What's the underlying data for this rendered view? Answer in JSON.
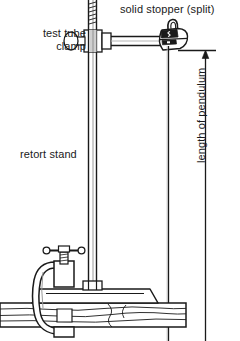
{
  "diagram": {
    "type": "physics-apparatus-line-drawing",
    "stroke_color": "#1a1a1a",
    "fill_color": "#ffffff",
    "background": "#ffffff",
    "width": 240,
    "height": 341
  },
  "labels": {
    "test_tube_clamp": "test tube\nclamp",
    "test_tube_clamp_line1": "test tube",
    "test_tube_clamp_line2": "clamp",
    "solid_stopper": "solid stopper (split)",
    "retort_stand": "retort stand",
    "length_of_pendulum": "length of pendulum"
  },
  "parts": {
    "retort_stand_rod": "vertical-rod",
    "retort_stand_base": "base-plate",
    "g_clamp": "g-clamp",
    "bench": "wooden-bench",
    "boss_head": "boss-head",
    "horizontal_rod": "horizontal-rod",
    "stopper": "split-cork-stopper",
    "pendulum_string": "string",
    "dimension_line": "length-dimension-arrow"
  },
  "annotations": {
    "dimension_top_y": 50,
    "dimension_arrow_direction": "up",
    "dimension_x": 205
  }
}
